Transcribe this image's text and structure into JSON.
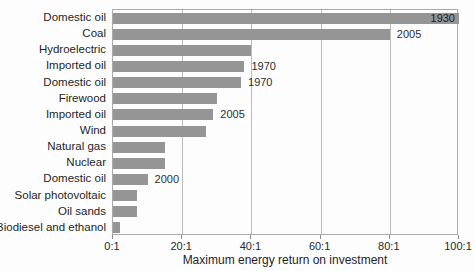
{
  "figure": {
    "background": "#fdfdfd",
    "bar_color": "#959595",
    "grid_color": "#bdbdbd",
    "axis_color": "#ababab",
    "text_color": "#1f1f1f"
  },
  "chart_data": {
    "type": "bar",
    "orientation": "horizontal",
    "title": "",
    "xlabel": "Maximum energy return on investment",
    "ylabel": "",
    "xlim": [
      0,
      100
    ],
    "grid": true,
    "legend": false,
    "xticks": [
      {
        "value": 0,
        "label": "0:1"
      },
      {
        "value": 20,
        "label": "20:1"
      },
      {
        "value": 40,
        "label": "40:1"
      },
      {
        "value": 60,
        "label": "60:1"
      },
      {
        "value": 80,
        "label": "80:1"
      },
      {
        "value": 100,
        "label": "100:1"
      }
    ],
    "bars": [
      {
        "category": "Domestic oil",
        "value": 100,
        "year": "1930",
        "year_inside": true
      },
      {
        "category": "Coal",
        "value": 80,
        "year": "2005",
        "year_inside": false
      },
      {
        "category": "Hydroelectric",
        "value": 40,
        "year": "",
        "year_inside": false
      },
      {
        "category": "Imported oil",
        "value": 38,
        "year": "1970",
        "year_inside": false
      },
      {
        "category": "Domestic oil",
        "value": 37,
        "year": "1970",
        "year_inside": false
      },
      {
        "category": "Firewood",
        "value": 30,
        "year": "",
        "year_inside": false
      },
      {
        "category": "Imported oil",
        "value": 29,
        "year": "2005",
        "year_inside": false
      },
      {
        "category": "Wind",
        "value": 27,
        "year": "",
        "year_inside": false
      },
      {
        "category": "Natural gas",
        "value": 15,
        "year": "",
        "year_inside": false
      },
      {
        "category": "Nuclear",
        "value": 15,
        "year": "",
        "year_inside": false
      },
      {
        "category": "Domestic oil",
        "value": 10,
        "year": "2000",
        "year_inside": false
      },
      {
        "category": "Solar photovoltaic",
        "value": 7,
        "year": "",
        "year_inside": false
      },
      {
        "category": "Oil sands",
        "value": 7,
        "year": "",
        "year_inside": false
      },
      {
        "category": "Biodiesel and ethanol",
        "value": 2,
        "year": "",
        "year_inside": false
      }
    ]
  }
}
